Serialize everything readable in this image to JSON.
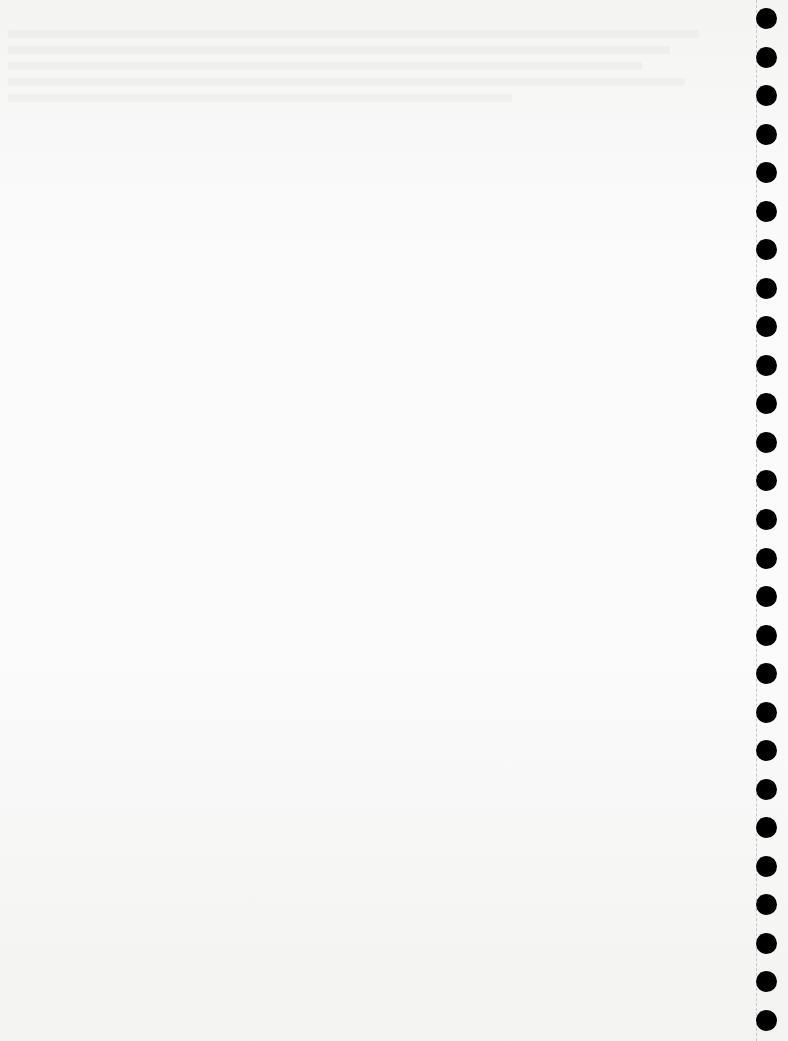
{
  "document": {
    "type": "blank-page",
    "background_color": "#fafafa",
    "binding": {
      "kind": "punched-holes",
      "side": "right",
      "hole_count": 27,
      "hole_color": "#000000",
      "perforation_line": "dashed"
    }
  }
}
